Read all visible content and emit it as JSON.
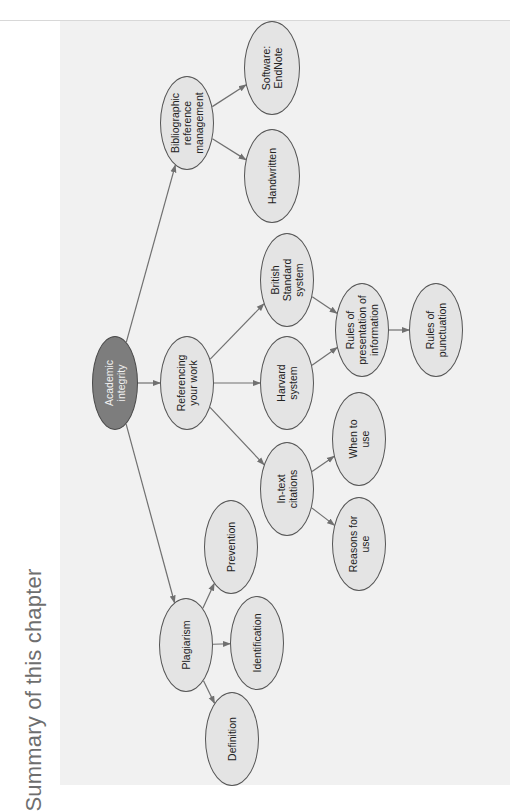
{
  "title": "Summary of this chapter",
  "colors": {
    "root_fill": "#7d7d7d",
    "node_fill": "#e4e4e4",
    "node_border": "#555555",
    "edge": "#707070",
    "panel": "#f1f1f1",
    "title_text": "#6e6e6e"
  },
  "nodes": {
    "academic_integrity": {
      "label": "Academic\nintegrity",
      "cx": 115,
      "cy": 383,
      "w": 46,
      "h": 94,
      "root": true
    },
    "bibliographic": {
      "label": "Bibliographic\nreference\nmanagement",
      "cx": 187,
      "cy": 123,
      "w": 54,
      "h": 94
    },
    "endnote": {
      "label": "Software:\nEndNote",
      "cx": 272,
      "cy": 68,
      "w": 56,
      "h": 94
    },
    "handwritten": {
      "label": "Handwritten",
      "cx": 272,
      "cy": 176,
      "w": 56,
      "h": 94
    },
    "referencing": {
      "label": "Referencing\nyour work",
      "cx": 187,
      "cy": 383,
      "w": 54,
      "h": 94
    },
    "british_standard": {
      "label": "British\nStandard\nsystem",
      "cx": 287,
      "cy": 280,
      "w": 54,
      "h": 94
    },
    "harvard": {
      "label": "Harvard\nsystem",
      "cx": 287,
      "cy": 383,
      "w": 54,
      "h": 94
    },
    "in_text": {
      "label": "In-text\ncitations",
      "cx": 287,
      "cy": 489,
      "w": 54,
      "h": 94
    },
    "rules_presentation": {
      "label": "Rules of\npresentation of\ninformation",
      "cx": 362,
      "cy": 330,
      "w": 54,
      "h": 94
    },
    "rules_punctuation": {
      "label": "Rules of\npunctuation",
      "cx": 436,
      "cy": 330,
      "w": 54,
      "h": 94
    },
    "when_to_use": {
      "label": "When to\nuse",
      "cx": 359,
      "cy": 439,
      "w": 54,
      "h": 94
    },
    "reasons_for_use": {
      "label": "Reasons for\nuse",
      "cx": 359,
      "cy": 544,
      "w": 54,
      "h": 94
    },
    "plagiarism": {
      "label": "Plagiarism",
      "cx": 186,
      "cy": 645,
      "w": 54,
      "h": 94
    },
    "prevention": {
      "label": "Prevention",
      "cx": 231,
      "cy": 547,
      "w": 54,
      "h": 94
    },
    "identification": {
      "label": "Identification",
      "cx": 257,
      "cy": 643,
      "w": 54,
      "h": 94
    },
    "definition": {
      "label": "Definition",
      "cx": 232,
      "cy": 739,
      "w": 54,
      "h": 94
    }
  },
  "edges": [
    [
      "academic_integrity",
      "bibliographic"
    ],
    [
      "academic_integrity",
      "referencing"
    ],
    [
      "academic_integrity",
      "plagiarism"
    ],
    [
      "bibliographic",
      "endnote"
    ],
    [
      "bibliographic",
      "handwritten"
    ],
    [
      "referencing",
      "british_standard"
    ],
    [
      "referencing",
      "harvard"
    ],
    [
      "referencing",
      "in_text"
    ],
    [
      "british_standard",
      "rules_presentation"
    ],
    [
      "harvard",
      "rules_presentation"
    ],
    [
      "rules_presentation",
      "rules_punctuation"
    ],
    [
      "in_text",
      "when_to_use"
    ],
    [
      "in_text",
      "reasons_for_use"
    ],
    [
      "plagiarism",
      "prevention"
    ],
    [
      "plagiarism",
      "identification"
    ],
    [
      "plagiarism",
      "definition"
    ]
  ]
}
